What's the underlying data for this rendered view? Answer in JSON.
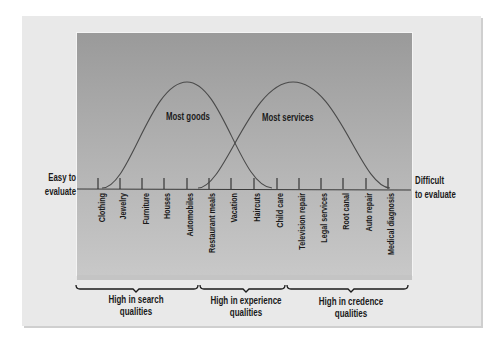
{
  "diagram": {
    "left_label": [
      "Easy to",
      "evaluate"
    ],
    "right_label": [
      "Difficult",
      "to evaluate"
    ],
    "curves": [
      {
        "name": "goods",
        "label": "Most goods"
      },
      {
        "name": "services",
        "label": "Most services"
      }
    ],
    "items": [
      "Clothing",
      "Jewelry",
      "Furniture",
      "Houses",
      "Automobiles",
      "Restaurant meals",
      "Vacation",
      "Haircuts",
      "Child care",
      "Television repair",
      "Legal services",
      "Root canal",
      "Auto repair",
      "Medical diagnosis"
    ],
    "categories": [
      {
        "line1": "High in search",
        "line2": "qualities"
      },
      {
        "line1": "High in experience",
        "line2": "qualities"
      },
      {
        "line1": "High in credence",
        "line2": "qualities"
      }
    ],
    "colors": {
      "panel_top": "#9a9a9a",
      "panel_bottom": "#c8c8c8",
      "card": "#e9e9e9",
      "line": "#3a3a3a"
    }
  }
}
